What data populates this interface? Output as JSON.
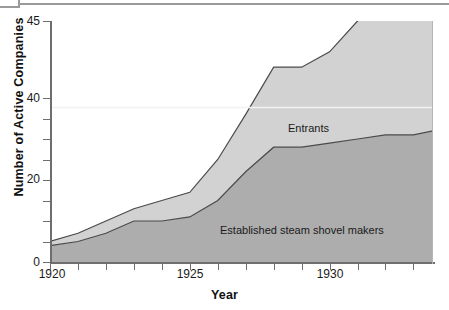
{
  "chart_data": {
    "type": "area",
    "stacked": true,
    "title": "",
    "xlabel": "Year",
    "ylabel": "Number of Active Companies",
    "xlim": [
      1920,
      1933.7
    ],
    "ylim": [
      0,
      45
    ],
    "grid": false,
    "legend_position": "inline-annotation",
    "x_ticks_labeled": [
      "1920",
      "1925",
      "1930"
    ],
    "x_tick_values": [
      1920,
      1921,
      1922,
      1923,
      1924,
      1925,
      1926,
      1927,
      1928,
      1929,
      1930,
      1931,
      1932,
      1933
    ],
    "y_ticks_labeled": [
      "0",
      "20",
      "40",
      "45"
    ],
    "y_tick_values": [
      0,
      5,
      10,
      15,
      20,
      25,
      30,
      35,
      40,
      45
    ],
    "y_axis_note": "broken axis: 40-45 segment stretched",
    "x": [
      1920,
      1921,
      1922,
      1923,
      1924,
      1925,
      1926,
      1927,
      1928,
      1929,
      1930,
      1931,
      1932,
      1933,
      1933.7
    ],
    "series": [
      {
        "name": "Established steam shovel makers",
        "color": "#adadad",
        "values": [
          4,
          5,
          7,
          10,
          10,
          11,
          15,
          22,
          28,
          28,
          29,
          30,
          31,
          31,
          32
        ]
      },
      {
        "name": "Entrants",
        "color": "#d2d2d2",
        "values": [
          1,
          2,
          3,
          3,
          5,
          6,
          10,
          14,
          14,
          14,
          14,
          15,
          16,
          18,
          19
        ]
      }
    ],
    "totals": [
      5,
      7,
      10,
      13,
      15,
      17,
      25,
      36,
      42,
      42,
      43,
      45,
      47,
      49,
      51
    ],
    "annotations": [
      {
        "text": "Entrants",
        "x": 1926.7,
        "y": 38
      },
      {
        "text": "Established steam shovel makers",
        "x": 1924.3,
        "y": 13
      }
    ]
  },
  "axis": {
    "y_labels": [
      {
        "text": "45",
        "top": 15
      },
      {
        "text": "40",
        "top": 92
      },
      {
        "text": "20",
        "top": 173
      },
      {
        "text": "0",
        "top": 256
      }
    ],
    "x_labels": [
      {
        "text": "1920",
        "left": 22
      },
      {
        "text": "1925",
        "left": 160
      },
      {
        "text": "1930",
        "left": 300
      }
    ],
    "x_title": "Year",
    "y_title": "Number of Active Companies"
  },
  "colors": {
    "established_fill": "#adadad",
    "entrants_fill": "#d2d2d2",
    "outline": "#4a4a4a",
    "axis": "#6e6e6e",
    "divider_highlight": "#f2f2f2",
    "text": "#1a1a1a",
    "background": "#ffffff"
  }
}
